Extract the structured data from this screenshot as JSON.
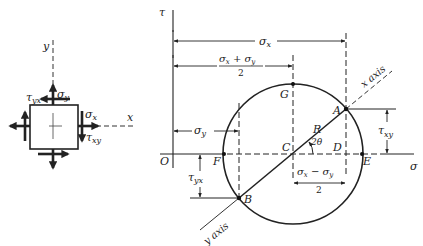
{
  "element": {
    "axis_x": "x",
    "axis_y": "y",
    "sigma_x": "σx",
    "sigma_y": "σy",
    "tau_xy": "τxy",
    "tau_yx": "τyx"
  },
  "circle": {
    "tau_axis": "τ",
    "sigma_axis": "σ",
    "origin": "O",
    "points": {
      "A": "A",
      "B": "B",
      "C": "C",
      "D": "D",
      "E": "E",
      "F": "F",
      "G": "G"
    },
    "radius": "R",
    "angle": "2θ",
    "x_axis": "x axis",
    "y_axis": "y axis",
    "dims": {
      "sigma_x": "σx",
      "avg_num": "σx + σy",
      "avg_den": "2",
      "sigma_y": "σy",
      "diff_num": "σx − σy",
      "diff_den": "2",
      "tau_xy": "τxy",
      "tau_yx": "τyx"
    }
  }
}
